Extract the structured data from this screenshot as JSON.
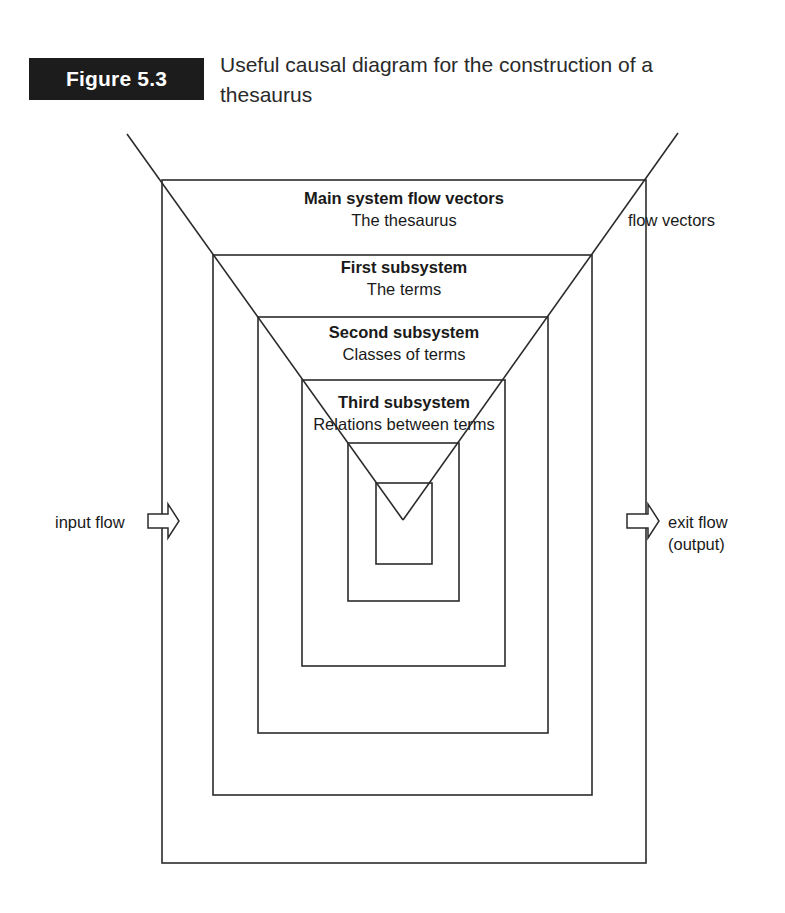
{
  "figure": {
    "badge": "Figure 5.3",
    "caption_line1": "Useful causal diagram for the construction of a",
    "caption_line2": "thesaurus"
  },
  "levels": [
    {
      "title": "Main system flow vectors",
      "subtitle": "The thesaurus"
    },
    {
      "title": "First subsystem",
      "subtitle": "The terms"
    },
    {
      "title": "Second subsystem",
      "subtitle": "Classes of terms"
    },
    {
      "title": "Third subsystem",
      "subtitle": "Relations between terms"
    }
  ],
  "side_labels": {
    "flow_vectors": "flow vectors",
    "input": "input flow",
    "exit_line1": "exit flow",
    "exit_line2": "(output)"
  },
  "colors": {
    "line": "#2b2b2b",
    "badge_bg": "#1c1c1c",
    "badge_text": "#ffffff"
  }
}
